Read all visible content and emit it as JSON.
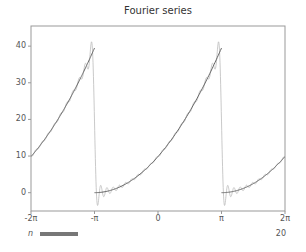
{
  "chart_data": {
    "type": "line",
    "title": "Fourier series",
    "xlabel": "",
    "ylabel": "",
    "xlim": [
      -6.2832,
      6.2832
    ],
    "ylim": [
      -5,
      45.5
    ],
    "grid": false,
    "x_ticks": [
      {
        "value": -6.2832,
        "label": "-2π"
      },
      {
        "value": -3.1416,
        "label": "-π"
      },
      {
        "value": 0,
        "label": "0"
      },
      {
        "value": 3.1416,
        "label": "π"
      },
      {
        "value": 6.2832,
        "label": "2π"
      }
    ],
    "y_ticks": [
      {
        "value": 0,
        "label": "0"
      },
      {
        "value": 10,
        "label": "10"
      },
      {
        "value": 20,
        "label": "20"
      },
      {
        "value": 30,
        "label": "30"
      },
      {
        "value": 40,
        "label": "40"
      }
    ],
    "series": [
      {
        "name": "f(x) = (x+π)² (periodic, period 2π)",
        "color": "#666666",
        "style": "true-function",
        "x": [
          -6.28,
          -5.5,
          -4.71,
          -3.93,
          -3.15,
          -3.14,
          -2.36,
          -1.57,
          -0.79,
          0,
          0.79,
          1.57,
          2.36,
          3.13,
          3.15,
          3.93,
          4.71,
          5.5,
          6.28
        ],
        "y": [
          9.87,
          13.9,
          18.5,
          23.4,
          39.4,
          0,
          0.6,
          2.5,
          5.6,
          9.87,
          15.4,
          22.2,
          30.2,
          39.4,
          0,
          0.6,
          2.5,
          5.6,
          9.87
        ]
      },
      {
        "name": "Fourier partial sum (n = 20)",
        "color": "#bbbbbb",
        "style": "approximation",
        "terms": 20,
        "note": "overshoots to ~41 before each jump at ±π and dips to ~-3 after (Gibbs phenomenon)"
      }
    ],
    "annotations": []
  },
  "slider": {
    "label": "n",
    "value": "20",
    "min": 1,
    "fill_fraction": 0.155
  }
}
